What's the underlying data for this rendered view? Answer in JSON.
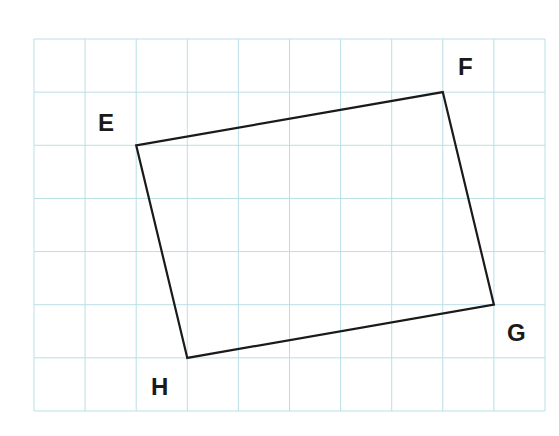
{
  "diagram": {
    "type": "quadrilateral-on-grid",
    "grid": {
      "columns": 10,
      "rows": 7,
      "line_color": "#b9dfe6"
    },
    "shape_color": "#1a1a1a",
    "vertices": [
      {
        "name": "E",
        "col": 2,
        "row": 2
      },
      {
        "name": "F",
        "col": 8,
        "row": 1
      },
      {
        "name": "G",
        "col": 9,
        "row": 5
      },
      {
        "name": "H",
        "col": 3,
        "row": 6
      }
    ],
    "labels": {
      "E": "E",
      "F": "F",
      "G": "G",
      "H": "H"
    }
  }
}
